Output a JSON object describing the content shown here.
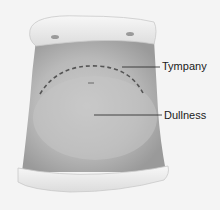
{
  "figure": {
    "colors": {
      "background": "#f4f4f4",
      "skin": "#b8b8b8",
      "skin_light": "#cfcfcf",
      "cloth": "#eeeeee",
      "dashed_line": "#555555",
      "leader_line": "#222222"
    }
  },
  "labels": {
    "tympany": "Tympany",
    "dullness": "Dullness"
  }
}
